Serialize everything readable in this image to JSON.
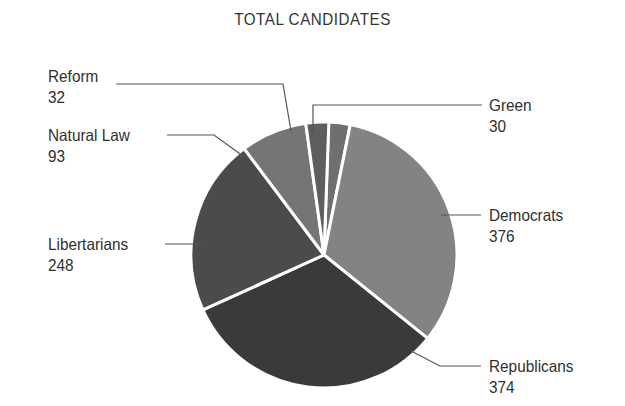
{
  "chart_data": {
    "type": "pie",
    "title": "TOTAL CANDIDATES",
    "xlabel": "",
    "ylabel": "",
    "legend_position": "none",
    "grid": false,
    "total": 1153,
    "categories": [
      "Green",
      "Democrats",
      "Republicans",
      "Libertarians",
      "Natural Law",
      "Reform"
    ],
    "values": [
      30,
      376,
      374,
      248,
      93,
      32
    ],
    "slices": [
      {
        "label": "Green",
        "value": 30,
        "value_text": "30",
        "color": "#6f6f6f",
        "start_angle": 2.0,
        "sweep": 9.4,
        "label_side": "right"
      },
      {
        "label": "Democrats",
        "value": 376,
        "value_text": "376",
        "color": "#838383",
        "start_angle": 11.4,
        "sweep": 117.4,
        "label_side": "right"
      },
      {
        "label": "Republicans",
        "value": 374,
        "value_text": "374",
        "color": "#3a3a3a",
        "start_angle": 128.8,
        "sweep": 116.8,
        "label_side": "right"
      },
      {
        "label": "Libertarians",
        "value": 248,
        "value_text": "248",
        "color": "#4b4b4b",
        "start_angle": 245.6,
        "sweep": 77.5,
        "label_side": "left"
      },
      {
        "label": "Natural Law",
        "value": 93,
        "value_text": "93",
        "color": "#757575",
        "start_angle": 323.1,
        "sweep": 29.0,
        "label_side": "left"
      },
      {
        "label": "Reform",
        "value": 32,
        "value_text": "32",
        "color": "#5e5e5e",
        "start_angle": 352.1,
        "sweep": 10.0,
        "label_side": "left"
      }
    ],
    "separator_color": "#ffffff",
    "leader_line_color": "#555555",
    "background_color": "#ffffff"
  },
  "labels": {
    "reform": {
      "name": "Reform",
      "value": "32"
    },
    "natural_law": {
      "name": "Natural Law",
      "value": "93"
    },
    "libertarians": {
      "name": "Libertarians",
      "value": "248"
    },
    "green": {
      "name": "Green",
      "value": "30"
    },
    "democrats": {
      "name": "Democrats",
      "value": "376"
    },
    "republicans": {
      "name": "Republicans",
      "value": "374"
    }
  }
}
